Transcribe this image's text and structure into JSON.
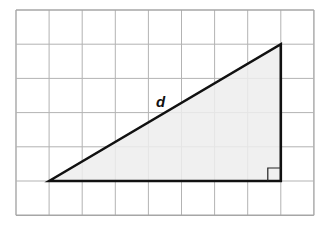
{
  "diagram": {
    "type": "right-triangle-on-grid",
    "grid": {
      "columns": 9,
      "rows": 6,
      "left": 16,
      "top": 10,
      "cell_width": 33.1,
      "cell_height": 34.2,
      "line_color": "#b3b3b3",
      "border_color": "#a6a6a6"
    },
    "triangle": {
      "vertices_grid": [
        [
          1,
          5
        ],
        [
          8,
          1
        ],
        [
          8,
          5
        ]
      ],
      "fill_color": "#ededed",
      "stroke_color": "#111111",
      "right_angle_vertex": [
        8,
        5
      ],
      "legs": {
        "horizontal_units": 7,
        "vertical_units": 4
      }
    },
    "labels": {
      "hypotenuse": "d"
    }
  }
}
